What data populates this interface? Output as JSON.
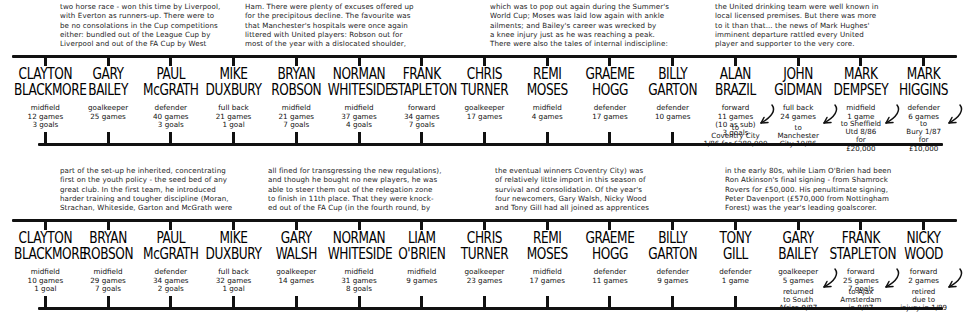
{
  "diagram": {
    "rows": [
      {
        "id": "row-1986",
        "narratives": [
          {
            "lines": [
              "two horse race - won this time by Liverpool,",
              "with Everton as runners-up. There were to",
              "be no consolations in the Cup competitions",
              "either: bundled out of the League Cup by",
              "Liverpool and out of the FA Cup by West"
            ]
          },
          {
            "lines": [
              "Ham. There were plenty of excuses offered up",
              "for the precipitous decline. The favourite was",
              "that Manchester's hospitals were once again",
              "littered with United players: Robson out for",
              "most of the year with a dislocated shoulder,"
            ]
          },
          {
            "lines": [
              "which was to pop out again during the Summer's",
              "World Cup; Moses was laid low again with ankle",
              "ailments; and Bailey's career was wrecked by",
              "a knee injury just as he was reaching a peak.",
              "There were also the tales of internal indiscipline:"
            ]
          },
          {
            "lines": [
              "the United drinking team were well known in",
              "local licensed premises. But there was more",
              "to it than that... the news of Mark Hughes'",
              "imminent departure rattled every United",
              "player and supporter to the very core."
            ]
          }
        ],
        "players": [
          {
            "name": [
              "CLAYTON",
              "BLACKMORE"
            ],
            "meta": [
              "midfield",
              "12 games",
              "3 goals"
            ],
            "note": null
          },
          {
            "name": [
              "GARY",
              "BAILEY"
            ],
            "meta": [
              "goalkeeper",
              "25 games"
            ],
            "note": null
          },
          {
            "name": [
              "PAUL",
              "McGRATH"
            ],
            "meta": [
              "defender",
              "40 games",
              "3 goals"
            ],
            "note": null
          },
          {
            "name": [
              "MIKE",
              "DUXBURY"
            ],
            "meta": [
              "full back",
              "21 games",
              "1 goal"
            ],
            "note": null
          },
          {
            "name": [
              "BRYAN",
              "ROBSON"
            ],
            "meta": [
              "midfield",
              "21 games",
              "7 goals"
            ],
            "note": null
          },
          {
            "name": [
              "NORMAN",
              "WHITESIDE"
            ],
            "meta": [
              "midfield",
              "37 games",
              "4 goals"
            ],
            "note": null
          },
          {
            "name": [
              "FRANK",
              "STAPLETON"
            ],
            "meta": [
              "forward",
              "34 games",
              "7 goals"
            ],
            "note": null
          },
          {
            "name": [
              "CHRIS",
              "TURNER"
            ],
            "meta": [
              "goalkeeper",
              "17 games"
            ],
            "note": null
          },
          {
            "name": [
              "REMI",
              "MOSES"
            ],
            "meta": [
              "midfield",
              "4 games"
            ],
            "note": null
          },
          {
            "name": [
              "GRAEME",
              "HOGG"
            ],
            "meta": [
              "defender",
              "17 games"
            ],
            "note": null
          },
          {
            "name": [
              "BILLY",
              "GARTON"
            ],
            "meta": [
              "defender",
              "10 games"
            ],
            "note": null
          },
          {
            "name": [
              "ALAN",
              "BRAZIL"
            ],
            "meta": [
              "forward",
              "11 games",
              "(10 as sub)",
              "3 goals"
            ],
            "note": [
              "to",
              "Coventry City",
              "1/86 for £280,000"
            ]
          },
          {
            "name": [
              "JOHN",
              "GIDMAN"
            ],
            "meta": [
              "full back",
              "24 games"
            ],
            "note": [
              "to",
              "Manchester",
              "City 10/86"
            ]
          },
          {
            "name": [
              "MARK",
              "DEMPSEY"
            ],
            "meta": [
              "midfield",
              "1 game"
            ],
            "note": [
              "to Sheffield",
              "Utd 8/86",
              "for",
              "£20,000"
            ]
          },
          {
            "name": [
              "MARK",
              "HIGGINS"
            ],
            "meta": [
              "defender",
              "6 games"
            ],
            "note": [
              "to",
              "Bury 1/87",
              "for",
              "£10,000"
            ]
          }
        ]
      },
      {
        "id": "row-1987",
        "narratives": [
          {
            "lines": [
              "part of the set-up he inherited, concentrating",
              "first on the youth policy - the seed bed of any",
              "great club. In the first team, he introduced",
              "harder training and tougher discipline (Moran,",
              "Strachan, Whiteside, Garton and McGrath were"
            ]
          },
          {
            "lines": [
              "all fined for transgressing the new regulations),",
              "and though he bought no new players, he was",
              "able to steer them out of the relegation zone",
              "to finish in 11th place. That they were knock-",
              "ed out of the FA Cup (in the fourth round, by"
            ]
          },
          {
            "lines": [
              "the eventual winners Coventry City) was",
              "of relatively little import in this season of",
              "survival and consolidation. Of the year's",
              "four newcomers, Gary Walsh, Nicky Wood",
              "and Tony Gill had all joined as apprentices"
            ]
          },
          {
            "lines": [
              "in the early 80s, while Liam O'Brien had been",
              "Ron Atkinson's final signing - from Shamrock",
              "Rovers for £50,000. His penultimate signing,",
              "Peter Davenport (£570,000 from Nottingham",
              "Forest) was the year's leading goalscorer."
            ]
          }
        ],
        "players": [
          {
            "name": [
              "CLAYTON",
              "BLACKMORE"
            ],
            "meta": [
              "midfield",
              "10 games",
              "1 goal"
            ],
            "note": null
          },
          {
            "name": [
              "BRYAN",
              "ROBSON"
            ],
            "meta": [
              "midfield",
              "29 games",
              "7 goals"
            ],
            "note": null
          },
          {
            "name": [
              "PAUL",
              "McGRATH"
            ],
            "meta": [
              "defender",
              "34 games",
              "2 goals"
            ],
            "note": null
          },
          {
            "name": [
              "MIKE",
              "DUXBURY"
            ],
            "meta": [
              "full back",
              "32 games",
              "1 goal"
            ],
            "note": null
          },
          {
            "name": [
              "GARY",
              "WALSH"
            ],
            "meta": [
              "goalkeeper",
              "14 games"
            ],
            "note": null
          },
          {
            "name": [
              "NORMAN",
              "WHITESIDE"
            ],
            "meta": [
              "midfield",
              "31 games",
              "8 goals"
            ],
            "note": null
          },
          {
            "name": [
              "LIAM",
              "O'BRIEN"
            ],
            "meta": [
              "midfield",
              "9 games"
            ],
            "note": null
          },
          {
            "name": [
              "CHRIS",
              "TURNER"
            ],
            "meta": [
              "goalkeeper",
              "23 games"
            ],
            "note": null
          },
          {
            "name": [
              "REMI",
              "MOSES"
            ],
            "meta": [
              "midfield",
              "17 games"
            ],
            "note": null
          },
          {
            "name": [
              "GRAEME",
              "HOGG"
            ],
            "meta": [
              "defender",
              "11 games"
            ],
            "note": null
          },
          {
            "name": [
              "BILLY",
              "GARTON"
            ],
            "meta": [
              "defender",
              "9 games"
            ],
            "note": null
          },
          {
            "name": [
              "TONY",
              "GILL"
            ],
            "meta": [
              "defender",
              "1 game"
            ],
            "note": null
          },
          {
            "name": [
              "GARY",
              "BAILEY"
            ],
            "meta": [
              "goalkeeper",
              "5 games"
            ],
            "note": [
              "returned",
              "to South",
              "Africa 9/87"
            ]
          },
          {
            "name": [
              "FRANK",
              "STAPLETON"
            ],
            "meta": [
              "forward",
              "25 games",
              "7 goals"
            ],
            "note": [
              "to Ajax",
              "Amsterdam",
              "in 8/87"
            ]
          },
          {
            "name": [
              "NICKY",
              "WOOD"
            ],
            "meta": [
              "forward",
              "2 games"
            ],
            "note": [
              "retired",
              "due to",
              "injury in 1/89"
            ]
          }
        ]
      }
    ]
  },
  "style": {
    "ink": "#111111",
    "paper": "#ffffff"
  }
}
